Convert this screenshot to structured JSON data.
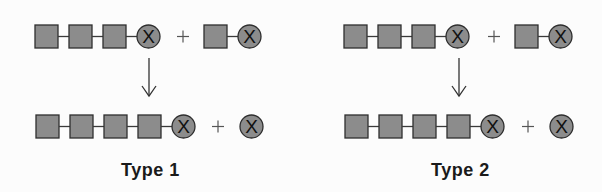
{
  "colors": {
    "unit_fill": "#8c8c8c",
    "unit_stroke": "#2e2e2e",
    "link": "#3a3a3a",
    "text": "#1a1a1a"
  },
  "symbols": {
    "unit": "square",
    "terminal": "circle-x",
    "terminal_glyph": "X",
    "plus": "+",
    "arrow": "down-arrow"
  },
  "panels": [
    {
      "label": "Type 1",
      "reactants": [
        {
          "units": 3,
          "terminal": "X"
        },
        {
          "units": 1,
          "terminal": "X"
        }
      ],
      "products": [
        {
          "units": 4,
          "terminal": "X"
        },
        {
          "units": 0,
          "terminal": "X"
        }
      ]
    },
    {
      "label": "Type 2",
      "reactants": [
        {
          "units": 3,
          "terminal": "X"
        },
        {
          "units": 1,
          "terminal": "X"
        }
      ],
      "products": [
        {
          "units": 4,
          "terminal": "X"
        },
        {
          "units": 0,
          "terminal": "X"
        }
      ]
    }
  ]
}
